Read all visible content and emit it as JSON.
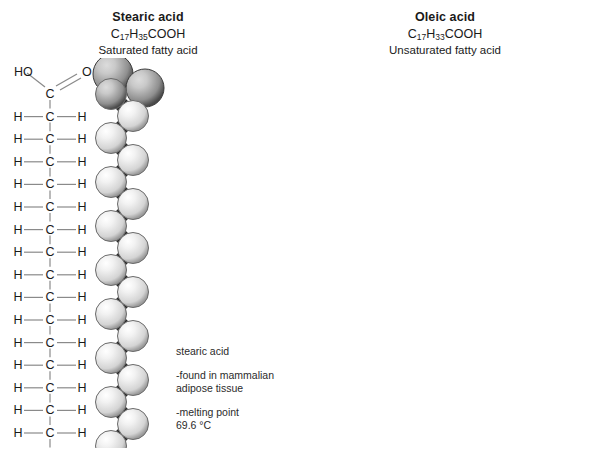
{
  "figure": {
    "background": "#ffffff",
    "panels": [
      {
        "id": "stearic",
        "title": "Stearic acid",
        "formula_prefix": "C",
        "formula_sub1": "17",
        "formula_mid": "H",
        "formula_sub2": "35",
        "formula_suffix": "COOH",
        "subtitle": "Saturated fatty acid",
        "head_label_left": "HO",
        "head_label_right": "O",
        "carbon_label": "C",
        "hydrogen_label": "H",
        "chain": {
          "carbons_below_carboxyl": 17,
          "double_bond_index": null,
          "terminal_hydrogen": "H",
          "shape": "straight"
        },
        "notes": [
          {
            "lines": [
              "stearic acid"
            ]
          },
          {
            "lines": [
              "-found in mammalian",
              "adipose tissue"
            ]
          },
          {
            "lines": [
              "-melting point",
              "69.6 °C"
            ]
          }
        ]
      },
      {
        "id": "oleic",
        "title": "Oleic acid",
        "formula_prefix": "C",
        "formula_sub1": "17",
        "formula_mid": "H",
        "formula_sub2": "33",
        "formula_suffix": "COOH",
        "subtitle": "Unsaturated fatty acid",
        "head_label_left": "HO",
        "head_label_right": "O",
        "carbon_label": "C",
        "hydrogen_label": "H",
        "chain": {
          "carbons_below_carboxyl": 17,
          "double_bond_index": 8,
          "terminal_hydrogen": "H",
          "shape": "kinked"
        },
        "notes": [
          {
            "lines": [
              "oleic acid"
            ]
          },
          {
            "lines": [
              "- found in",
              "olive oil"
            ]
          },
          {
            "lines": [
              "-melting point",
              "13.4 °C"
            ]
          }
        ]
      }
    ],
    "colors": {
      "line": "#8a8a8a",
      "text": "#1a1a1a",
      "note_text": "#2b2b2b",
      "sphere_light": "#d4d4d4",
      "sphere_light_hi": "#f2f2f2",
      "sphere_dark": "#8f8f8f",
      "sphere_dark_hi": "#c9c9c9",
      "bond_dark": "#2a2a2a"
    }
  }
}
